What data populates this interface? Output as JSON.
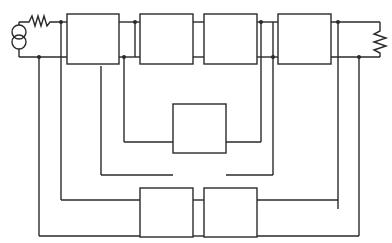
{
  "diagram": {
    "type": "circuit-block-diagram",
    "stroke_color": "#2a2a2a",
    "background": "#ffffff",
    "components": {
      "source": {
        "kind": "current-source",
        "symbol": "two-circle-source"
      },
      "source_resistor": {
        "kind": "resistor",
        "symbol": "zigzag"
      },
      "load_resistor": {
        "kind": "resistor",
        "symbol": "zigzag"
      }
    },
    "blocks": [
      {
        "id": "block-1",
        "label": ""
      },
      {
        "id": "block-2",
        "label": ""
      },
      {
        "id": "block-3",
        "label": ""
      },
      {
        "id": "block-4",
        "label": ""
      },
      {
        "id": "block-feedback-middle",
        "label": ""
      },
      {
        "id": "block-feedback-bottom-left",
        "label": ""
      },
      {
        "id": "block-feedback-bottom-right",
        "label": ""
      }
    ]
  }
}
